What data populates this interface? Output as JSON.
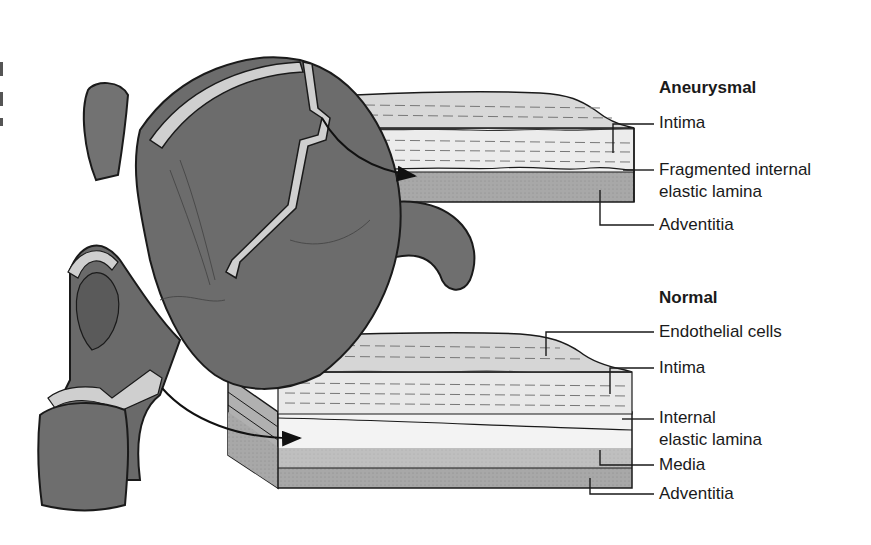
{
  "figure": {
    "colors": {
      "vessel": "#6e6e6e",
      "vessel_dark": "#5a5a5a",
      "vessel_wall_cut": "#cfcfcf",
      "intima": "#e6e6e6",
      "elastic_lamina": "#f4f4f4",
      "media": "#bdbdbd",
      "adventitia": "#a3a3a3",
      "outline": "#1a1a1a"
    }
  },
  "aneurysmal": {
    "heading": "Aneurysmal",
    "labels": {
      "intima": "Intima",
      "fragmented_lamina_line1": "Fragmented internal",
      "fragmented_lamina_line2": "elastic lamina",
      "adventitia": "Adventitia"
    }
  },
  "normal": {
    "heading": "Normal",
    "labels": {
      "endothelial": "Endothelial cells",
      "intima": "Intima",
      "internal_lamina_line1": "Internal",
      "internal_lamina_line2": "elastic lamina",
      "media": "Media",
      "adventitia": "Adventitia"
    }
  }
}
